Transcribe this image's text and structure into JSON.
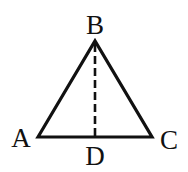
{
  "diagram": {
    "type": "triangle-with-altitude",
    "stroke_color": "#111111",
    "background": "#ffffff",
    "vertices": {
      "A": {
        "label": "A",
        "x": 38,
        "y": 137
      },
      "B": {
        "label": "B",
        "x": 95,
        "y": 41
      },
      "C": {
        "label": "C",
        "x": 152,
        "y": 137
      },
      "D": {
        "label": "D",
        "x": 95,
        "y": 137
      }
    },
    "segments": [
      {
        "from": "A",
        "to": "B",
        "style": "solid"
      },
      {
        "from": "B",
        "to": "C",
        "style": "solid"
      },
      {
        "from": "A",
        "to": "C",
        "style": "solid"
      },
      {
        "from": "B",
        "to": "D",
        "style": "dashed"
      }
    ],
    "labels": {
      "A": "A",
      "B": "B",
      "C": "C",
      "D": "D"
    }
  }
}
